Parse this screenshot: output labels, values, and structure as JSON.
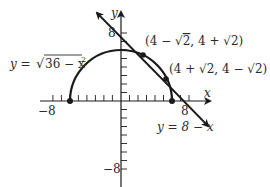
{
  "diagram": {
    "type": "coordinate-graph",
    "axes": {
      "x_label": "x",
      "y_label": "y",
      "x_tick_left": "−8",
      "x_tick_right": "8",
      "y_tick_top": "8",
      "y_tick_bottom": "−8",
      "range": [
        -8,
        8
      ]
    },
    "curves": [
      {
        "name": "semicircle",
        "equation_prefix": "y = ",
        "radicand": "36 − x",
        "exponent": "2"
      },
      {
        "name": "line",
        "equation": "y = 8 − x"
      }
    ],
    "points": [
      {
        "label_a": "(4 − ",
        "root_a": "2",
        "label_b": ", 4 + ",
        "root_b": "2",
        "label_c": ")"
      },
      {
        "label_a": "(4 + ",
        "root_a": "2",
        "label_b": ", 4 − ",
        "root_b": "2",
        "label_c": ")"
      }
    ],
    "endpoints": [
      {
        "x": -6,
        "y": 0
      },
      {
        "x": 6,
        "y": 0
      }
    ],
    "color": "#1a1a1a"
  }
}
